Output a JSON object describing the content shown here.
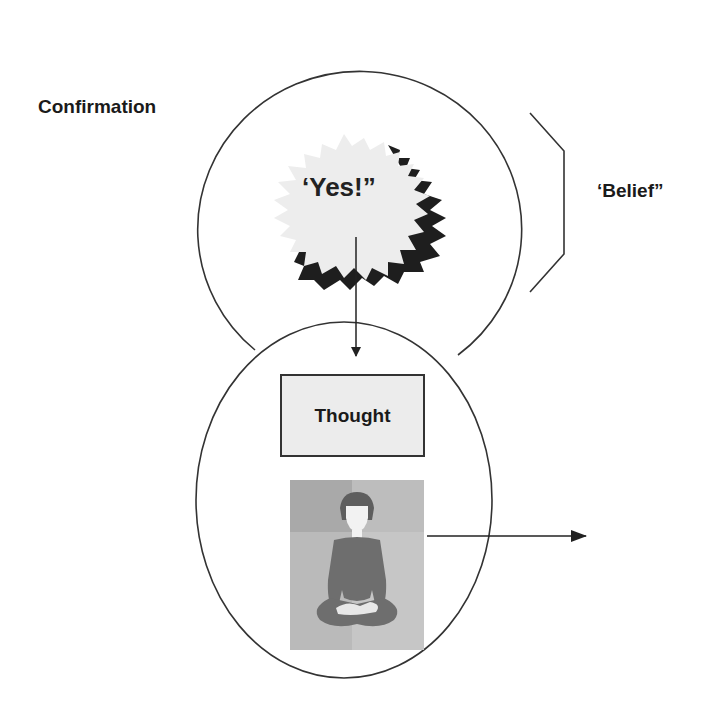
{
  "diagram": {
    "labels": {
      "confirmation": "Confirmation",
      "belief": "‘Belief”",
      "exclamation": "‘Yes!”",
      "thought": "Thought"
    },
    "elements": {
      "upper_circle": "Confirmation / Belief circle",
      "lower_circle": "Thought circle",
      "starburst": "Yes! starburst",
      "bracket": "Belief bracket",
      "arrow_down": "Yes! to Thought arrow",
      "arrow_right": "Meditation output arrow",
      "image": "Meditating person illustration"
    },
    "colors": {
      "stroke": "#333333",
      "text": "#1a1a1a",
      "starburst_fill": "#ededed",
      "starburst_shadow": "#1e1e1e",
      "box_fill": "#ececec",
      "image_bg_dark": "#a9a9a9",
      "image_bg_light": "#c6c6c6",
      "figure": "#6e6e6e"
    }
  }
}
